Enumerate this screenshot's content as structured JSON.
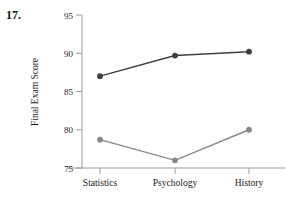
{
  "figure": {
    "problem_number": "17.",
    "background_color": "#ffffff"
  },
  "chart_data": {
    "type": "line",
    "title": "",
    "xlabel": "",
    "ylabel": "Final Exam Score",
    "categories": [
      "Statistics",
      "Psychology",
      "History"
    ],
    "ylim": [
      75,
      95
    ],
    "yticks": [
      75,
      80,
      85,
      90,
      95
    ],
    "ytick_labels": [
      "75",
      "80",
      "85",
      "90",
      "95"
    ],
    "grid": false,
    "legend": "none",
    "series": [
      {
        "name": "upper-series",
        "values": [
          87.0,
          89.7,
          90.2
        ],
        "color": "#3f3f3f",
        "marker": "circle"
      },
      {
        "name": "lower-series",
        "values": [
          78.7,
          76.0,
          80.0
        ],
        "color": "#888888",
        "marker": "circle"
      }
    ],
    "axis_color": "#999999"
  },
  "ytick_0": "75",
  "ytick_1": "80",
  "ytick_2": "85",
  "ytick_3": "90",
  "ytick_4": "95",
  "cat_0": "Statistics",
  "cat_1": "Psychology",
  "cat_2": "History",
  "ylabel_text": "Final Exam Score"
}
